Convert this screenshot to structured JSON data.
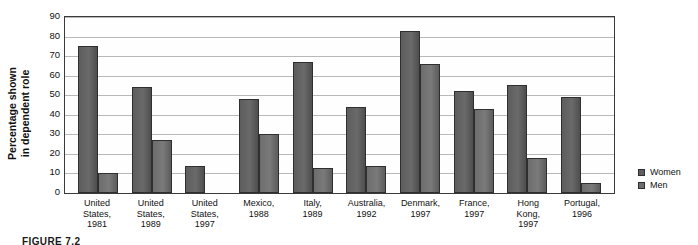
{
  "figure": {
    "caption": "FIGURE 7.2"
  },
  "legend": {
    "position": "right",
    "entries": [
      {
        "label": "Women",
        "color": "#5d5d5d"
      },
      {
        "label": "Men",
        "color": "#6d6d6d"
      }
    ]
  },
  "axis": {
    "ylabel_line1": "Percentage shown",
    "ylabel_line2": "in dependent role",
    "yticks": [
      0,
      10,
      20,
      30,
      40,
      50,
      60,
      70,
      80,
      90
    ]
  },
  "chart_data": {
    "type": "bar",
    "title": "",
    "xlabel": "",
    "ylabel": "Percentage shown in dependent role",
    "ylim": [
      0,
      90
    ],
    "ytick_step": 10,
    "grid": true,
    "legend_position": "right",
    "categories": [
      "United States, 1981",
      "United States, 1989",
      "United States, 1997",
      "Mexico, 1988",
      "Italy, 1989",
      "Australia, 1992",
      "Denmark, 1997",
      "France, 1997",
      "Hong Kong, 1997",
      "Portugal, 1996"
    ],
    "category_lines": [
      [
        "United",
        "States,",
        "1981"
      ],
      [
        "United",
        "States,",
        "1989"
      ],
      [
        "United",
        "States,",
        "1997"
      ],
      [
        "Mexico,",
        "1988"
      ],
      [
        "Italy,",
        "1989"
      ],
      [
        "Australia,",
        "1992"
      ],
      [
        "Denmark,",
        "1997"
      ],
      [
        "France,",
        "1997"
      ],
      [
        "Hong",
        "Kong,",
        "1997"
      ],
      [
        "Portugal,",
        "1996"
      ]
    ],
    "series": [
      {
        "name": "Women",
        "color": "#5d5d5d",
        "values": [
          75,
          54,
          14,
          48,
          67,
          44,
          83,
          52,
          55,
          49
        ]
      },
      {
        "name": "Men",
        "color": "#6d6d6d",
        "values": [
          10,
          27,
          null,
          30,
          13,
          14,
          66,
          43,
          18,
          5
        ]
      }
    ]
  }
}
